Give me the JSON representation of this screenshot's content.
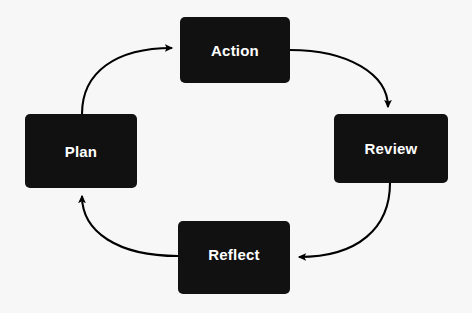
{
  "diagram": {
    "type": "cycle",
    "direction": "clockwise",
    "background_color": "#f7f7f7",
    "node_fill_color": "#111111",
    "node_text_color": "#ffffff",
    "arrow_color": "#000000",
    "nodes": [
      {
        "id": "action",
        "label": "Action"
      },
      {
        "id": "review",
        "label": "Review"
      },
      {
        "id": "reflect",
        "label": "Reflect"
      },
      {
        "id": "plan",
        "label": "Plan"
      }
    ],
    "arrows": [
      {
        "id": "plan-to-action",
        "from": "Plan",
        "to": "Action",
        "label": ""
      },
      {
        "id": "action-to-review",
        "from": "Action",
        "to": "Review",
        "label": ""
      },
      {
        "id": "review-to-reflect",
        "from": "Review",
        "to": "Reflect",
        "label": ""
      },
      {
        "id": "reflect-to-plan",
        "from": "Reflect",
        "to": "Plan",
        "label": ""
      }
    ]
  }
}
